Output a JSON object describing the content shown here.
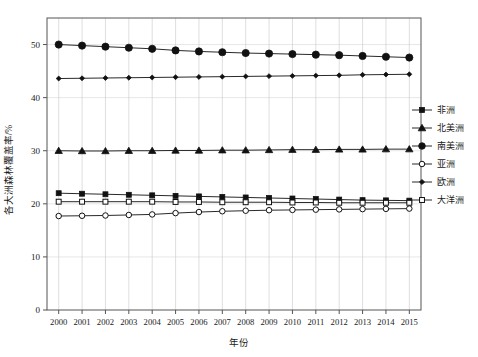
{
  "chart_data": {
    "type": "line",
    "title": "",
    "xlabel": "年份",
    "ylabel": "各大洲森林覆盖率/%",
    "x": [
      2000,
      2001,
      2002,
      2003,
      2004,
      2005,
      2006,
      2007,
      2008,
      2009,
      2010,
      2011,
      2012,
      2013,
      2014,
      2015
    ],
    "xlim": [
      1999.5,
      2015.5
    ],
    "ylim": [
      0,
      55
    ],
    "yticks": [
      0,
      10,
      20,
      30,
      40,
      50
    ],
    "grid": "vertical-and-horizontal",
    "legend_position": "right-outside",
    "series": [
      {
        "name": "非洲",
        "marker": "filled-square",
        "values": [
          22.0,
          21.9,
          21.8,
          21.7,
          21.6,
          21.5,
          21.4,
          21.3,
          21.2,
          21.1,
          21.0,
          20.9,
          20.8,
          20.7,
          20.65,
          20.6
        ]
      },
      {
        "name": "北美洲",
        "marker": "filled-triangle",
        "values": [
          30.0,
          29.95,
          29.95,
          30.0,
          30.0,
          30.05,
          30.05,
          30.1,
          30.1,
          30.15,
          30.2,
          30.2,
          30.25,
          30.25,
          30.3,
          30.3
        ]
      },
      {
        "name": "南美洲",
        "marker": "filled-circle",
        "values": [
          50.0,
          49.8,
          49.6,
          49.4,
          49.2,
          48.9,
          48.7,
          48.55,
          48.4,
          48.3,
          48.2,
          48.1,
          48.0,
          47.85,
          47.7,
          47.55
        ]
      },
      {
        "name": "亚洲",
        "marker": "open-circle",
        "values": [
          17.7,
          17.75,
          17.8,
          17.9,
          18.0,
          18.25,
          18.45,
          18.6,
          18.7,
          18.8,
          18.85,
          18.9,
          18.95,
          19.0,
          19.05,
          19.1
        ]
      },
      {
        "name": "欧洲",
        "marker": "filled-diamond",
        "values": [
          43.6,
          43.65,
          43.7,
          43.75,
          43.8,
          43.85,
          43.9,
          43.95,
          44.0,
          44.05,
          44.1,
          44.15,
          44.2,
          44.3,
          44.35,
          44.4
        ]
      },
      {
        "name": "大洋洲",
        "marker": "open-square",
        "values": [
          20.4,
          20.4,
          20.4,
          20.4,
          20.4,
          20.35,
          20.35,
          20.3,
          20.3,
          20.3,
          20.25,
          20.25,
          20.2,
          20.2,
          20.2,
          20.2
        ]
      }
    ],
    "legend": [
      {
        "label": "非洲",
        "marker": "filled-square"
      },
      {
        "label": "北美洲",
        "marker": "filled-triangle"
      },
      {
        "label": "南美洲",
        "marker": "filled-circle"
      },
      {
        "label": "亚洲",
        "marker": "open-circle"
      },
      {
        "label": "欧洲",
        "marker": "filled-diamond"
      },
      {
        "label": "大洋洲",
        "marker": "open-square"
      }
    ],
    "colors": {
      "marker": "#111111",
      "line": "#111111",
      "grid": "#cccccc",
      "axis": "#555555"
    }
  }
}
